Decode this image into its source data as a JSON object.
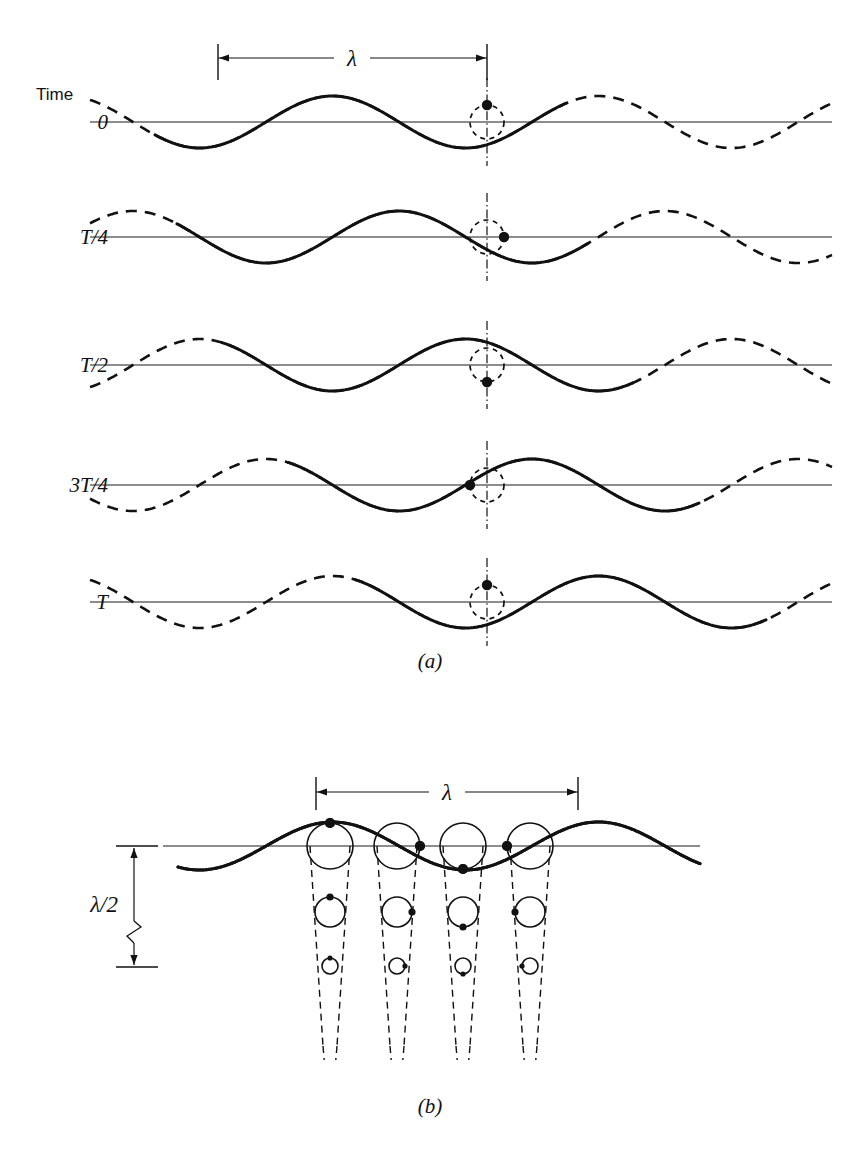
{
  "figure": {
    "background": "#ffffff",
    "ink": "#111111",
    "width": 859,
    "height": 1160
  },
  "panel_a": {
    "caption": "(a)",
    "caption_pos": {
      "x": 430,
      "y": 668
    },
    "time_header": "Time",
    "time_header_pos": {
      "x": 36,
      "y": 100
    },
    "label_x": 108,
    "axis": {
      "x_start": 90,
      "x_end": 832
    },
    "wavelength_px": 266,
    "amplitude_px": 26,
    "solid_span_wavelengths": 1.55,
    "marker_x": 487,
    "circle_radius": 17,
    "dim": {
      "label": "λ",
      "y": 58,
      "x_left": 218,
      "x_right": 487,
      "tick_top": 44,
      "tick_bottom": 80,
      "label_x": 352,
      "label_y": 66
    },
    "rows": [
      {
        "label": "0",
        "baseline_y": 122,
        "phase_fraction": 0.0,
        "marker_phase_deg": 90,
        "solid_start_x": 155,
        "dot_on_curve": true
      },
      {
        "label": "T/4",
        "baseline_y": 237,
        "phase_fraction": 0.25,
        "marker_phase_deg": 0,
        "solid_start_x": 177,
        "dot_on_curve": true
      },
      {
        "label": "T/2",
        "baseline_y": 365,
        "phase_fraction": 0.5,
        "marker_phase_deg": -90,
        "solid_start_x": 222,
        "dot_on_curve": true
      },
      {
        "label": "3T/4",
        "baseline_y": 485,
        "phase_fraction": 0.75,
        "marker_phase_deg": 180,
        "solid_start_x": 288,
        "dot_on_curve": true
      },
      {
        "label": "T",
        "baseline_y": 602,
        "phase_fraction": 1.0,
        "marker_phase_deg": 90,
        "solid_start_x": 355,
        "dot_on_curve": true
      }
    ]
  },
  "panel_b": {
    "caption": "(b)",
    "caption_pos": {
      "x": 430,
      "y": 1113
    },
    "axis": {
      "y": 846,
      "x_start": 163,
      "x_end": 700
    },
    "wave": {
      "wavelength_px": 266,
      "amplitude_px": 24,
      "x_start": 178,
      "x_end": 700,
      "phase_offset_px": 0
    },
    "dim_lambda": {
      "label": "λ",
      "y": 792,
      "x_left": 316,
      "x_right": 578,
      "tick_top": 777,
      "tick_bottom": 810,
      "label_x": 447,
      "label_y": 800
    },
    "dim_half_lambda": {
      "label": "λ/2",
      "x": 152,
      "y_top": 846,
      "y_bottom": 967,
      "label_x": 118,
      "label_y": 912,
      "tick_len": 36,
      "break_y": 935
    },
    "source_columns": [
      {
        "x": 330,
        "dot_phase_deg": 90
      },
      {
        "x": 397,
        "dot_phase_deg": 0
      },
      {
        "x": 463,
        "dot_phase_deg": -90
      },
      {
        "x": 530,
        "dot_phase_deg": 180
      }
    ],
    "tiers": [
      {
        "y": 846,
        "radius": 23,
        "dot_radius": 5.0,
        "style": "solid"
      },
      {
        "y": 912,
        "radius": 15,
        "dot_radius": 3.6,
        "style": "solid"
      },
      {
        "y": 966,
        "radius": 8,
        "dot_radius": 2.6,
        "style": "solid"
      }
    ],
    "ray_spread_top": 20,
    "ray_spread_bottom": 7,
    "ray_y_end": 1046,
    "ray_y_tail_end": 1060
  }
}
